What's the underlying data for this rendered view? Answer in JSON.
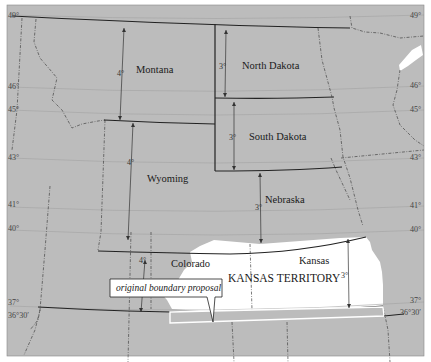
{
  "map": {
    "colors": {
      "background": "#bcbcbc",
      "frame": "#ffffff",
      "territory": "#ffffff",
      "border": "#2a2a2a",
      "graticule": "#9a9a9a",
      "proposal_strip": "#bcbcbc",
      "proposal_outline": "#ffffff"
    },
    "states": [
      {
        "name": "Montana",
        "x": 136,
        "y": 73
      },
      {
        "name": "North Dakota",
        "x": 242,
        "y": 69
      },
      {
        "name": "South Dakota",
        "x": 249,
        "y": 140
      },
      {
        "name": "Wyoming",
        "x": 147,
        "y": 182
      },
      {
        "name": "Nebraska",
        "x": 265,
        "y": 203
      },
      {
        "name": "Colorado",
        "x": 171,
        "y": 267
      },
      {
        "name": "Kansas",
        "x": 299,
        "y": 264
      }
    ],
    "territory_label": "KANSAS TERRITORY",
    "callout_label": "original boundary proposal",
    "span_labels": [
      {
        "text": "4°",
        "x": 117,
        "y": 76
      },
      {
        "text": "3°",
        "x": 219,
        "y": 69
      },
      {
        "text": "3°",
        "x": 232,
        "y": 140
      },
      {
        "text": "4°",
        "x": 127,
        "y": 165
      },
      {
        "text": "3°",
        "x": 256,
        "y": 208
      },
      {
        "text": "4°",
        "x": 140,
        "y": 263
      },
      {
        "text": "3°",
        "x": 343,
        "y": 276
      }
    ],
    "left_latitudes": [
      {
        "text": "49°",
        "x": 9,
        "y": 18
      },
      {
        "text": "46°",
        "x": 9,
        "y": 89
      },
      {
        "text": "45°",
        "x": 9,
        "y": 112
      },
      {
        "text": "43°",
        "x": 9,
        "y": 160
      },
      {
        "text": "41°",
        "x": 9,
        "y": 208
      },
      {
        "text": "40°",
        "x": 9,
        "y": 232
      },
      {
        "text": "37°",
        "x": 9,
        "y": 305
      },
      {
        "text": "36°30′",
        "x": 9,
        "y": 318
      }
    ],
    "right_latitudes": [
      {
        "text": "49°",
        "x": 415,
        "y": 18
      },
      {
        "text": "46°",
        "x": 415,
        "y": 88
      },
      {
        "text": "45°",
        "x": 415,
        "y": 112
      },
      {
        "text": "43°",
        "x": 415,
        "y": 160
      },
      {
        "text": "41°",
        "x": 415,
        "y": 208
      },
      {
        "text": "40°",
        "x": 415,
        "y": 232
      },
      {
        "text": "37°",
        "x": 415,
        "y": 303
      },
      {
        "text": "36°30′",
        "x": 415,
        "y": 315
      }
    ]
  }
}
